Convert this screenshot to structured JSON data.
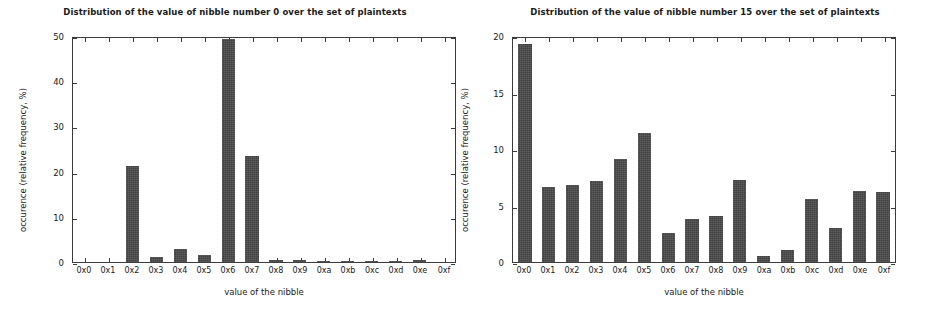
{
  "figure": {
    "background": "#ffffff",
    "bar_color": "#4a4a4a",
    "axis_color": "#3c3c3c"
  },
  "chart_data": [
    {
      "type": "bar",
      "title": "Distribution of the value of nibble number 0 over the set of plaintexts",
      "xlabel": "value of the nibble",
      "ylabel": "occurence (relative frequency, %)",
      "categories": [
        "0x0",
        "0x1",
        "0x2",
        "0x3",
        "0x4",
        "0x5",
        "0x6",
        "0x7",
        "0x8",
        "0x9",
        "0xa",
        "0xb",
        "0xc",
        "0xd",
        "0xe",
        "0xf"
      ],
      "values": [
        0.0,
        0.0,
        21.3,
        1.1,
        2.8,
        1.5,
        49.3,
        23.4,
        0.5,
        0.4,
        0.2,
        0.1,
        0.1,
        0.1,
        0.5,
        0.0
      ],
      "ylim": [
        0,
        50
      ],
      "yticks": [
        0,
        10,
        20,
        30,
        40,
        50
      ],
      "ytick_labels": [
        "0",
        "10",
        "20",
        "30",
        "40",
        "50"
      ],
      "grid": false,
      "legend": null
    },
    {
      "type": "bar",
      "title": "Distribution of the value of nibble number 15 over the set of plaintexts",
      "xlabel": "value of the nibble",
      "ylabel": "occurence (relative frequency, %)",
      "categories": [
        "0x0",
        "0x1",
        "0x2",
        "0x3",
        "0x4",
        "0x5",
        "0x6",
        "0x7",
        "0x8",
        "0x9",
        "0xa",
        "0xb",
        "0xc",
        "0xd",
        "0xe",
        "0xf"
      ],
      "values": [
        19.3,
        6.6,
        6.8,
        7.2,
        9.1,
        11.4,
        2.6,
        3.8,
        4.1,
        7.3,
        0.5,
        1.1,
        5.6,
        3.0,
        6.3,
        6.2
      ],
      "ylim": [
        0,
        20
      ],
      "yticks": [
        0,
        5,
        10,
        15,
        20
      ],
      "ytick_labels": [
        "0",
        "5",
        "10",
        "15",
        "20"
      ],
      "grid": false,
      "legend": null
    }
  ]
}
